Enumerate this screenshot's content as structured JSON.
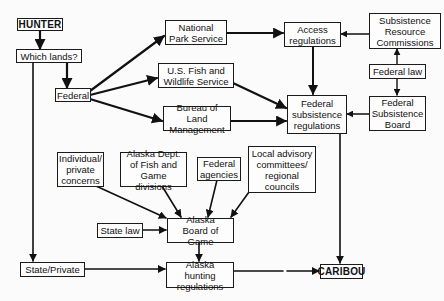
{
  "diagram": {
    "nodes": {
      "hunter": "HUNTER",
      "which_lands": "Which lands?",
      "federal": "Federal",
      "nps": "National\nPark Service",
      "usfws": "U.S. Fish and\nWildlife Service",
      "blm": "Bureau of Land\nManagement",
      "access_regs": "Access\nregulations",
      "src": "Subsistence\nResource\nCommissions",
      "federal_law": "Federal law",
      "fsb": "Federal\nSubsistence\nBoard",
      "fed_subsistence_regs": "Federal\nsubsistence\nregulations",
      "individual": "Individual/\nprivate\nconcerns",
      "adfg": "Alaska Dept.\nof Fish and\nGame divisions",
      "federal_agencies": "Federal\nagencies",
      "local_advisory": "Local advisory\ncommittees/\nregional\ncouncils",
      "state_law": "State law",
      "board_of_game": "Alaska\nBoard of Game",
      "state_private": "State/Private",
      "ak_hunting_regs": "Alaska hunting\nregulations",
      "caribou": "CARIBOU"
    },
    "edges": [
      {
        "from": "HUNTER",
        "to": "Which lands?"
      },
      {
        "from": "Which lands?",
        "to": "Federal"
      },
      {
        "from": "Which lands?",
        "to": "State/Private"
      },
      {
        "from": "Federal",
        "to": "National Park Service"
      },
      {
        "from": "Federal",
        "to": "U.S. Fish and Wildlife Service"
      },
      {
        "from": "Federal",
        "to": "Bureau of Land Management"
      },
      {
        "from": "National Park Service",
        "to": "Access regulations"
      },
      {
        "from": "Subsistence Resource Commissions",
        "to": "Access regulations"
      },
      {
        "from": "Access regulations",
        "to": "Federal subsistence regulations"
      },
      {
        "from": "U.S. Fish and Wildlife Service",
        "to": "Federal subsistence regulations"
      },
      {
        "from": "Bureau of Land Management",
        "to": "Federal subsistence regulations"
      },
      {
        "from": "Federal law",
        "to": "Subsistence Resource Commissions"
      },
      {
        "from": "Federal law",
        "to": "Federal Subsistence Board"
      },
      {
        "from": "Federal Subsistence Board",
        "to": "Federal subsistence regulations"
      },
      {
        "from": "Federal subsistence regulations",
        "to": "CARIBOU"
      },
      {
        "from": "Individual/private concerns",
        "to": "Alaska Board of Game"
      },
      {
        "from": "Alaska Dept. of Fish and Game divisions",
        "to": "Alaska Board of Game"
      },
      {
        "from": "Federal agencies",
        "to": "Alaska Board of Game"
      },
      {
        "from": "Local advisory committees/regional councils",
        "to": "Alaska Board of Game"
      },
      {
        "from": "State law",
        "to": "Alaska Board of Game"
      },
      {
        "from": "Alaska Board of Game",
        "to": "Alaska hunting regulations"
      },
      {
        "from": "State/Private",
        "to": "Alaska hunting regulations"
      },
      {
        "from": "Alaska hunting regulations",
        "to": "CARIBOU"
      }
    ],
    "colors": {
      "line": "#111111",
      "box_border": "#1a1a1a",
      "background": "#fbfbfb"
    }
  }
}
